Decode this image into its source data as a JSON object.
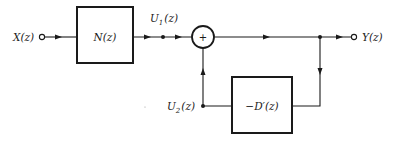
{
  "diagram": {
    "type": "block-diagram",
    "input": {
      "label": "X(z)"
    },
    "output": {
      "label": "Y(z)"
    },
    "blocks": [
      {
        "id": "N",
        "label": "N(z)"
      },
      {
        "id": "D",
        "label": "−D′(z)"
      }
    ],
    "summing_junction": {
      "symbol": "+"
    },
    "signals": {
      "u1": {
        "main": "U",
        "sub": "1",
        "arg": "(z)"
      },
      "u2": {
        "main": "U",
        "sub": "2",
        "arg": "(z)"
      }
    },
    "connections": [
      "X(z) → N(z)",
      "N(z) → U1(z) → summer",
      "summer → Y(z)",
      "Y(z) → −D′(z)",
      "−D′(z) → U2(z) → summer"
    ],
    "colors": {
      "stroke": "#1a1a1a",
      "background": "#ffffff"
    }
  }
}
